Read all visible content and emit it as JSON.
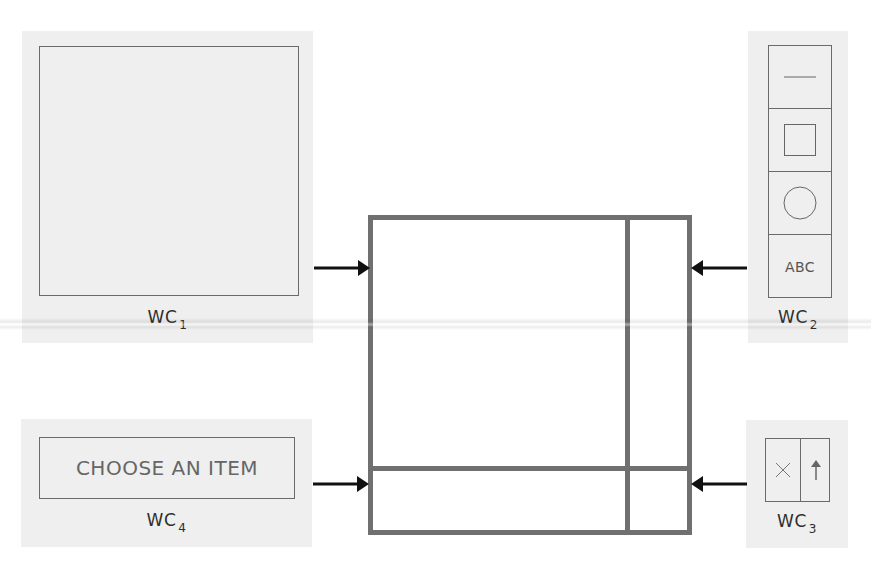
{
  "components": {
    "wc1": {
      "label": "WC",
      "index": "1",
      "role": "canvas"
    },
    "wc2": {
      "label": "WC",
      "index": "2",
      "role": "tool-palette",
      "tools": [
        {
          "name": "line",
          "icon": "line-icon"
        },
        {
          "name": "rectangle",
          "icon": "square-icon"
        },
        {
          "name": "ellipse",
          "icon": "circle-icon"
        },
        {
          "name": "text",
          "icon": "text-icon",
          "text": "ABC"
        }
      ]
    },
    "wc3": {
      "label": "WC",
      "index": "3",
      "role": "buttons",
      "buttons": [
        {
          "name": "cancel",
          "icon": "close-icon",
          "glyph": "×"
        },
        {
          "name": "confirm",
          "icon": "arrow-up-icon",
          "glyph": "↑"
        }
      ]
    },
    "wc4": {
      "label": "WC",
      "index": "4",
      "role": "dropdown",
      "text": "CHOOSE AN ITEM"
    }
  },
  "composite_window": {
    "regions": [
      "main-area",
      "right-column",
      "bottom-row",
      "bottom-right-cell"
    ]
  },
  "colors": {
    "panel_bg": "#efefef",
    "frame_border": "#707070",
    "thin_border": "#6a6a6a",
    "arrow": "#111111"
  }
}
